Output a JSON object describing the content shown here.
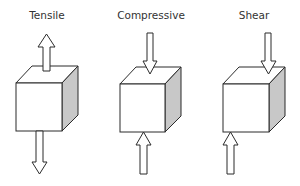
{
  "diagram": {
    "panels": [
      {
        "title": "Tensile",
        "forces": "outward arrows on top and bottom faces"
      },
      {
        "title": "Compressive",
        "forces": "inward arrows on top and bottom faces"
      },
      {
        "title": "Shear",
        "forces": "offset opposing arrows on top-right and bottom-left"
      }
    ]
  },
  "colors": {
    "stroke": "#2b2b2b",
    "side_shade": "#c8c8c8",
    "fill": "#ffffff",
    "text": "#333333"
  }
}
